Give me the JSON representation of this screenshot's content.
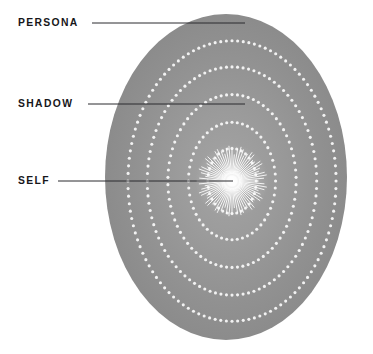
{
  "diagram": {
    "type": "concentric-ellipse-diagram",
    "canvas": {
      "width": 373,
      "height": 354,
      "background": "#ffffff"
    },
    "field": {
      "name": "psyche-field",
      "shape": "ellipse",
      "center_x": 226,
      "center_y": 177,
      "radius_x": 121,
      "radius_y": 163,
      "fill_outer": "#8b8b8b",
      "fill_inner": "#a2a2a2",
      "description": "Large vertical gray ellipse filling most of the frame"
    },
    "rings": {
      "name": "concentric-dotted-rings",
      "count": 5,
      "dot_color": "#f2f2f2",
      "dot_radius": 1.55,
      "scales": [
        0.86,
        0.7,
        0.53,
        0.36,
        0.2
      ],
      "dot_counts": [
        116,
        96,
        74,
        52,
        32
      ]
    },
    "core": {
      "name": "self-core-starburst",
      "center_x": 232,
      "center_y": 181,
      "ray_count": 72,
      "ray_inner_radius": 7,
      "ray_outer_radius": 31,
      "ray_color": "#ffffff",
      "glow_radius": 13,
      "glow_color": "#ffffff"
    },
    "labels": [
      {
        "id": "persona",
        "text": "PERSONA",
        "x": 18,
        "y": 17,
        "leader": {
          "x1": 92,
          "y1": 23,
          "x2": 245,
          "y2": 23
        }
      },
      {
        "id": "shadow",
        "text": "SHADOW",
        "x": 18,
        "y": 98,
        "leader": {
          "x1": 88,
          "y1": 104,
          "x2": 245,
          "y2": 104
        }
      },
      {
        "id": "self",
        "text": "SELF",
        "x": 18,
        "y": 175,
        "leader": {
          "x1": 58,
          "y1": 181,
          "x2": 233,
          "y2": 181
        }
      }
    ],
    "leader_line": {
      "color": "#2a2a2e",
      "width": 1
    }
  }
}
